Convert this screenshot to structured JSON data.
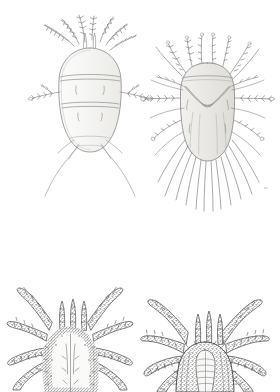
{
  "plate": {
    "title": "Plate of mites (Acari), dorsal views",
    "background_color": "#ffffff",
    "ink_color": "#6e6e6e",
    "dark_ink_color": "#4a4a4a",
    "body_fill_light": "#f7f7f5",
    "body_fill_shaded": "#e6e5e2",
    "width": 280,
    "height": 392,
    "technique": "pen-and-ink stipple line drawing",
    "artist_mark": "m"
  },
  "figures": [
    {
      "id": "figure-top-left",
      "position": "top-left",
      "subject": "mite, dorsal view",
      "description": "Oval segmented idiosoma with two transverse dorsal furrows, short branched gnathosoma setae fanning forward, one pair of barbed lateral legs, and two long smooth trailing setae",
      "shading": "light outline with faint wash",
      "leg_pairs_visible": 1,
      "long_trailing_setae": 2,
      "center_x": 90,
      "center_y": 105,
      "body_width": 62,
      "body_height": 100
    },
    {
      "id": "figure-top-right",
      "position": "top-right",
      "subject": "mite, dorsal view",
      "description": "Rounded-rectangular idiosoma with V-shaped dorsal suture, crown of plumose anterior appendages, barbed lateral legs extending horizontally, and a dense fringe of long posterior setae",
      "shading": "stippled grey wash on body",
      "leg_pairs_visible": 4,
      "long_trailing_setae": 12,
      "center_x": 213,
      "center_y": 110,
      "body_width": 64,
      "body_height": 108
    },
    {
      "id": "figure-bottom-left",
      "position": "bottom-left",
      "subject": "mite, dorsal view, cropped at page edge",
      "description": "Pale granulate oval idiosoma with a median longitudinal line, four pairs of thick, heavily annulated and spined legs spreading outward, and a pair of erect palps",
      "shading": "dark stipple, heavy texture",
      "leg_pairs_visible": 4,
      "long_trailing_setae": 0,
      "center_x": 70,
      "center_y": 372,
      "body_width": 62,
      "body_height": 90
    },
    {
      "id": "figure-bottom-right",
      "position": "bottom-right",
      "subject": "mite, ventral/dorsal view, cropped at page edge",
      "description": "Dark stippled body with strongly annulated spiny legs radiating upward and outward and a pale striated median gnathosoma",
      "shading": "dark stipple, heavy texture",
      "leg_pairs_visible": 4,
      "long_trailing_setae": 0,
      "center_x": 205,
      "center_y": 378,
      "body_width": 58,
      "body_height": 86
    }
  ]
}
